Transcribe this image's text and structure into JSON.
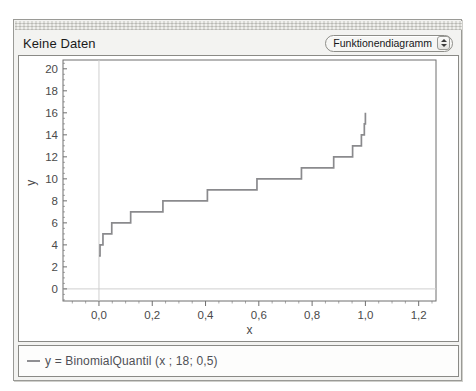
{
  "window": {
    "title": "Keine Daten",
    "diagram_type_selector": {
      "selected": "Funktionendiagramm",
      "up_arrow_icon": "triangle-up-icon",
      "down_arrow_icon": "triangle-down-icon"
    }
  },
  "legend": {
    "entries": [
      {
        "swatch_color": "#8f8f92",
        "label": "y = BinomialQuantil (x ; 18; 0,5)"
      }
    ]
  },
  "colors": {
    "curve": "#8a8a8d",
    "axis": "#6f6f6f",
    "gridline": "#cfcfcf",
    "tick_label": "#4a4a4a",
    "panel_background": "#ffffff",
    "window_background": "#f3f3f1",
    "window_border": "#9a9a96"
  },
  "chart_data": {
    "type": "line",
    "title": "",
    "subtitle": "",
    "xlabel": "x",
    "ylabel": "y",
    "xlim": [
      -0.135,
      1.265
    ],
    "ylim": [
      -1.1,
      20.8
    ],
    "xticks": [
      0.0,
      0.2,
      0.4,
      0.6,
      0.8,
      1.0,
      1.2
    ],
    "xticklabels": [
      "0,0",
      "0,2",
      "0,4",
      "0,6",
      "0,8",
      "1,0",
      "1,2"
    ],
    "yticks": [
      0,
      2,
      4,
      6,
      8,
      10,
      12,
      14,
      16,
      18,
      20
    ],
    "yticklabels": [
      "0",
      "2",
      "4",
      "6",
      "8",
      "10",
      "12",
      "14",
      "16",
      "18",
      "20"
    ],
    "x_minor_tick_step": 0.05,
    "y_minor_tick_step": 0.5,
    "grid": true,
    "gridlines": {
      "x": [
        0.0
      ],
      "y": [
        0.0
      ]
    },
    "legend": "bottom",
    "step_style": "post",
    "series": [
      {
        "name": "y = BinomialQuantil (x ; 18; 0,5)",
        "color": "#8a8a8d",
        "x": [
          0.0,
          0.004,
          0.004,
          0.015,
          0.015,
          0.048,
          0.048,
          0.119,
          0.119,
          0.24,
          0.24,
          0.407,
          0.407,
          0.593,
          0.593,
          0.76,
          0.76,
          0.881,
          0.881,
          0.952,
          0.952,
          0.985,
          0.985,
          0.996,
          0.996,
          1.0,
          1.0
        ],
        "y": [
          3,
          3,
          4,
          4,
          5,
          5,
          6,
          6,
          7,
          7,
          8,
          8,
          9,
          9,
          10,
          10,
          11,
          11,
          12,
          12,
          13,
          13,
          14,
          14,
          15,
          15,
          16
        ],
        "description": "Quantilfunktion der Binomialverteilung mit n = 18 und p = 0,5; Treppenfunktion von y = 3 bis y = 16"
      }
    ]
  }
}
